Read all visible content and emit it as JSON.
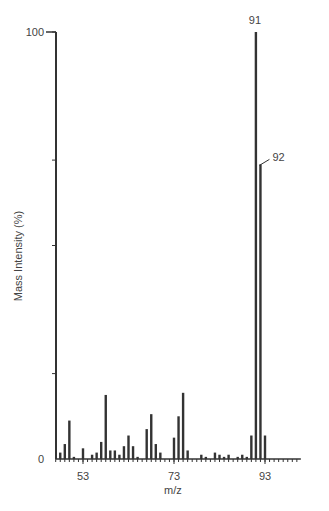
{
  "chart_data": {
    "type": "bar",
    "title": "",
    "xlabel": "m/z",
    "ylabel": "Mass Intensity (%)",
    "xlim": [
      47,
      100
    ],
    "ylim": [
      0,
      100
    ],
    "x_ticks": [
      53,
      73,
      93
    ],
    "y_ticks": [
      0,
      100
    ],
    "y_tick_labels": [
      "0",
      "100"
    ],
    "grid": false,
    "annotations": [
      {
        "text": "91",
        "x": 91,
        "y": 100
      },
      {
        "text": "92",
        "x": 92,
        "y": 69
      }
    ],
    "x": [
      48,
      49,
      50,
      51,
      52,
      53,
      54,
      55,
      56,
      57,
      58,
      59,
      60,
      61,
      62,
      63,
      64,
      65,
      66,
      67,
      68,
      69,
      70,
      71,
      72,
      73,
      74,
      75,
      76,
      77,
      78,
      79,
      80,
      81,
      82,
      83,
      84,
      85,
      86,
      87,
      88,
      89,
      90,
      91,
      92,
      93
    ],
    "values": [
      1.5,
      3.5,
      9,
      0.5,
      0,
      2.5,
      0,
      1,
      1.5,
      4,
      15,
      2,
      2,
      1,
      3,
      5.5,
      3,
      0.5,
      0,
      7,
      10.5,
      3.5,
      1.5,
      0,
      0,
      5,
      10,
      15.5,
      2,
      0,
      0,
      1,
      0.5,
      0,
      1.5,
      1,
      0.5,
      1,
      0,
      0.5,
      1,
      0.5,
      5.5,
      100,
      69,
      5.5
    ]
  }
}
